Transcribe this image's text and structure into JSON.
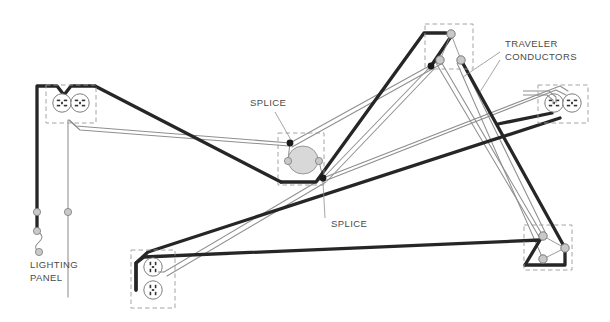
{
  "diagram": {
    "colors": {
      "cable_black": "#262626",
      "conductor_gray": "#8c8c8c",
      "conductor_light": "#b5b5b5",
      "box_dashed": "#9a9a9a",
      "device_outline": "#6e6e6e",
      "device_fill": "#ffffff",
      "terminal_fill": "#c9c9c9",
      "splice_dot": "#1a1a1a",
      "label_text": "#4a4a4a",
      "background": "#ffffff",
      "fixture_fill": "#d8d8d8"
    },
    "labels": [
      {
        "id": "splice-upper",
        "text": "SPLICE",
        "x": 250,
        "y": 106
      },
      {
        "id": "splice-lower",
        "text": "SPLICE",
        "x": 331,
        "y": 227
      },
      {
        "id": "traveler-line-1",
        "text": "TRAVELER",
        "x": 505,
        "y": 47
      },
      {
        "id": "traveler-line-2",
        "text": "CONDUCTORS",
        "x": 505,
        "y": 60
      },
      {
        "id": "lighting-panel-line-1",
        "text": "LIGHTING",
        "x": 30,
        "y": 268
      },
      {
        "id": "lighting-panel-line-2",
        "text": "PANEL",
        "x": 30,
        "y": 281
      }
    ],
    "devices": [
      {
        "id": "receptacle-upper-left",
        "type": "duplex-receptacle",
        "orientation": "horizontal",
        "box": {
          "x": 46,
          "y": 85,
          "w": 50,
          "h": 38
        },
        "outlets": [
          {
            "cx": 62,
            "cy": 103
          },
          {
            "cx": 80,
            "cy": 103
          }
        ]
      },
      {
        "id": "receptacle-bottom-center",
        "type": "duplex-receptacle",
        "orientation": "vertical",
        "box": {
          "x": 131,
          "y": 250,
          "w": 44,
          "h": 58
        },
        "outlets": [
          {
            "cx": 153,
            "cy": 267
          },
          {
            "cx": 153,
            "cy": 290
          }
        ]
      },
      {
        "id": "receptacle-right",
        "type": "duplex-receptacle",
        "orientation": "horizontal",
        "box": {
          "x": 538,
          "y": 85,
          "w": 50,
          "h": 38
        },
        "outlets": [
          {
            "cx": 554,
            "cy": 103
          },
          {
            "cx": 572,
            "cy": 103
          }
        ]
      },
      {
        "id": "switch-top-right",
        "type": "three-way-switch",
        "box": {
          "x": 425,
          "y": 24,
          "w": 48,
          "h": 45
        },
        "terminals": [
          {
            "role": "common",
            "cx": 451,
            "cy": 34
          },
          {
            "role": "traveler-1",
            "cx": 440,
            "cy": 60
          },
          {
            "role": "traveler-2",
            "cx": 461,
            "cy": 60
          }
        ]
      },
      {
        "id": "switch-bottom-right",
        "type": "three-way-switch",
        "box": {
          "x": 524,
          "y": 225,
          "w": 48,
          "h": 45
        },
        "terminals": [
          {
            "role": "traveler-1",
            "cx": 543,
            "cy": 236
          },
          {
            "role": "traveler-2",
            "cx": 543,
            "cy": 259
          },
          {
            "role": "common",
            "cx": 565,
            "cy": 248
          }
        ]
      },
      {
        "id": "junction-box-center",
        "type": "junction-box-with-fixture",
        "box": {
          "x": 278,
          "y": 133,
          "w": 46,
          "h": 52
        },
        "fixture": {
          "cx": 303,
          "cy": 160,
          "rx": 15,
          "ry": 14
        }
      },
      {
        "id": "lighting-panel",
        "type": "panel-feed",
        "terminals": [
          {
            "cx": 37,
            "cy": 212
          },
          {
            "cx": 37,
            "cy": 231
          },
          {
            "cx": 39,
            "cy": 252
          },
          {
            "cx": 68,
            "cy": 212
          }
        ]
      }
    ],
    "splices": [
      {
        "id": "splice-node-upper",
        "cx": 290,
        "cy": 143
      },
      {
        "id": "splice-node-lower",
        "cx": 323,
        "cy": 178
      },
      {
        "id": "splice-node-switch",
        "cx": 431,
        "cy": 66
      }
    ]
  }
}
